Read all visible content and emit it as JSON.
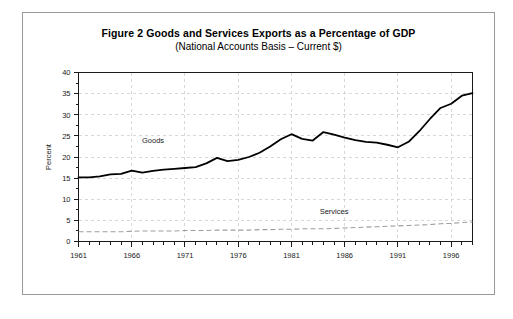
{
  "figure": {
    "title": "Figure 2  Goods and Services Exports as a Percentage of GDP",
    "subtitle": "(National Accounts Basis – Current $)"
  },
  "chart_data": {
    "type": "line",
    "title": "Figure 2  Goods and Services Exports as a Percentage of GDP",
    "subtitle": "(National Accounts Basis – Current $)",
    "xlabel": "",
    "ylabel": "Percent",
    "xlim": [
      1961,
      1998
    ],
    "ylim": [
      0,
      40
    ],
    "ytick_step": 5,
    "yticks": [
      0,
      5,
      10,
      15,
      20,
      25,
      30,
      35,
      40
    ],
    "ytick_labels": [
      "0",
      "5",
      "10",
      "15",
      "20",
      "25",
      "30",
      "35",
      "40"
    ],
    "xticks": [
      1961,
      1966,
      1971,
      1976,
      1981,
      1986,
      1991,
      1996
    ],
    "xtick_labels": [
      "1961",
      "1966",
      "1971",
      "1976",
      "1981",
      "1986",
      "1991",
      "1996"
    ],
    "x_minor_tick_step": 1,
    "y_minor_tick_step": 2.5,
    "grid": true,
    "grid_style": "dashed",
    "grid_color": "#c8c8c8",
    "legend_position": "inline-annotation",
    "x": [
      1961,
      1962,
      1963,
      1964,
      1965,
      1966,
      1967,
      1968,
      1969,
      1970,
      1971,
      1972,
      1973,
      1974,
      1975,
      1976,
      1977,
      1978,
      1979,
      1980,
      1981,
      1982,
      1983,
      1984,
      1985,
      1986,
      1987,
      1988,
      1989,
      1990,
      1991,
      1992,
      1993,
      1994,
      1995,
      1996,
      1997,
      1998
    ],
    "series": [
      {
        "name": "Goods",
        "color": "#000000",
        "style": "solid",
        "label_x": 1968,
        "label_y": 23.2,
        "values": [
          15.2,
          15.2,
          15.4,
          15.9,
          16.0,
          16.8,
          16.3,
          16.7,
          17.0,
          17.2,
          17.4,
          17.6,
          18.5,
          19.8,
          19.0,
          19.3,
          20.0,
          21.0,
          22.5,
          24.2,
          25.4,
          24.3,
          23.9,
          25.9,
          25.3,
          24.6,
          24.0,
          23.6,
          23.4,
          22.9,
          22.3,
          23.6,
          26.1,
          29.0,
          31.6,
          32.6,
          34.5,
          35.1
        ]
      },
      {
        "name": "Services",
        "color": "#9e9e9e",
        "style": "dashed",
        "label_x": 1985,
        "label_y": 6.4,
        "values": [
          2.3,
          2.3,
          2.3,
          2.3,
          2.3,
          2.4,
          2.5,
          2.5,
          2.5,
          2.5,
          2.6,
          2.6,
          2.6,
          2.7,
          2.7,
          2.7,
          2.7,
          2.8,
          2.8,
          2.9,
          2.9,
          3.0,
          3.0,
          3.0,
          3.1,
          3.2,
          3.3,
          3.4,
          3.5,
          3.6,
          3.7,
          3.8,
          3.9,
          4.0,
          4.2,
          4.3,
          4.5,
          4.6
        ]
      }
    ]
  }
}
